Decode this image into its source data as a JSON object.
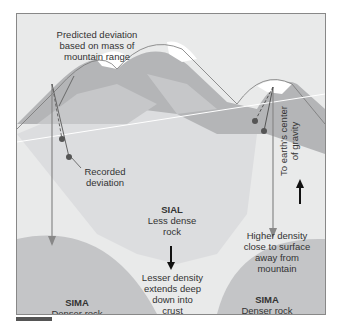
{
  "diagram": {
    "labels": {
      "predicted": "Predicted deviation\nbased on mass of\nmountain range",
      "recorded": "Recorded\ndeviation",
      "center_gravity": "To earth's center\nof gravity",
      "sial_title": "SIAL",
      "sial_desc": "Less dense\nrock",
      "lesser_density": "Lesser density\nextends deep\ndown into\ncrust",
      "higher_density": "Higher density\nclose to surface\naway from\nmountain",
      "sima_left_title": "SIMA",
      "sima_left_desc": "Denser rock",
      "sima_right_title": "SIMA",
      "sima_right_desc": "Denser rock"
    },
    "colors": {
      "background": "#e9eaea",
      "sima": "#c4c5c7",
      "mountain_dark": "#b4b5b7",
      "mountain_mid": "#d0d1d3",
      "snow": "#ffffff",
      "plumb_line": "#888888",
      "bob": "#555555",
      "arrow": "#111111"
    }
  }
}
